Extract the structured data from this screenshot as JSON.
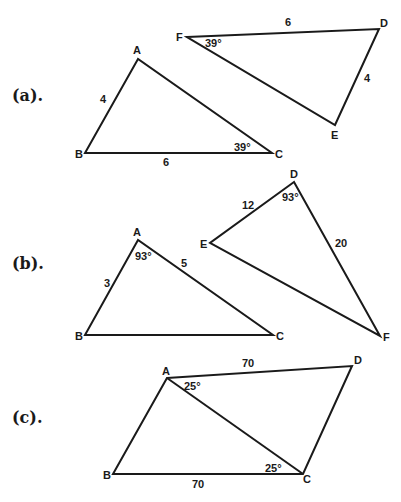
{
  "sections": [
    {
      "label": "(a).",
      "figures": [
        {
          "name": "triangle-ABC",
          "vertices": {
            "A": "A",
            "B": "B",
            "C": "C"
          },
          "sides": {
            "AB": "4",
            "BC": "6"
          },
          "angles": {
            "C": "39°"
          }
        },
        {
          "name": "triangle-DEF",
          "vertices": {
            "D": "D",
            "E": "E",
            "F": "F"
          },
          "sides": {
            "FD": "6",
            "DE": "4"
          },
          "angles": {
            "F": "39°"
          }
        }
      ]
    },
    {
      "label": "(b).",
      "figures": [
        {
          "name": "triangle-ABC",
          "vertices": {
            "A": "A",
            "B": "B",
            "C": "C"
          },
          "sides": {
            "AB": "3",
            "AC": "5"
          },
          "angles": {
            "A": "93°"
          }
        },
        {
          "name": "triangle-DEF",
          "vertices": {
            "D": "D",
            "E": "E",
            "F": "F"
          },
          "sides": {
            "ED": "12",
            "DF": "20"
          },
          "angles": {
            "D": "93°"
          }
        }
      ]
    },
    {
      "label": "(c).",
      "figures": [
        {
          "name": "quadrilateral-ABCD-with-diagonal-AC",
          "vertices": {
            "A": "A",
            "B": "B",
            "C": "C",
            "D": "D"
          },
          "sides": {
            "AD": "70",
            "BC": "70"
          },
          "angles": {
            "DAC": "25°",
            "BCA": "25°"
          }
        }
      ]
    }
  ]
}
